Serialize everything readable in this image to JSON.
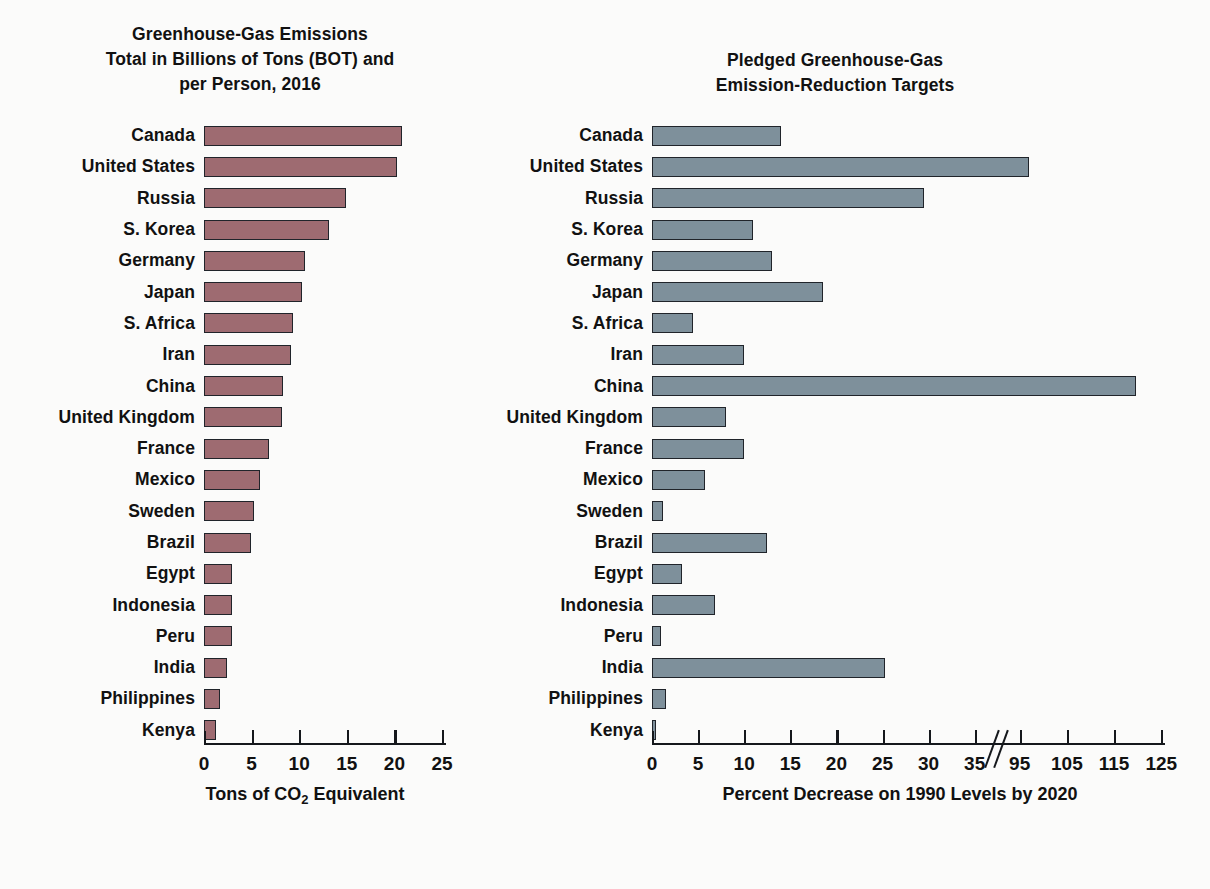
{
  "chart_data": [
    {
      "type": "bar",
      "orientation": "horizontal",
      "title": "Greenhouse-Gas Emissions Total in Billions of Tons (BOT) and per Person, 2016",
      "title_lines": [
        "Greenhouse-Gas Emissions",
        "Total in Billions of Tons (BOT) and",
        "per Person, 2016"
      ],
      "xlabel": "Tons of CO2 Equivalent",
      "xlabel_parts": {
        "pre": "Tons of CO",
        "sub": "2",
        "post": " Equivalent"
      },
      "ylabel": "",
      "xlim": [
        0,
        25
      ],
      "xticks": [
        0,
        5,
        10,
        15,
        20,
        25
      ],
      "xticklabels": [
        "0",
        "5",
        "10",
        "15",
        "20",
        "25"
      ],
      "grid": false,
      "legend": "none",
      "bar_color": "#9e6b71",
      "bar_edge_color": "#20242a",
      "categories": [
        "Canada",
        "United States",
        "Russia",
        "S. Korea",
        "Germany",
        "Japan",
        "S. Africa",
        "Iran",
        "China",
        "United Kingdom",
        "France",
        "Mexico",
        "Sweden",
        "Brazil",
        "Egypt",
        "Indonesia",
        "Peru",
        "India",
        "Philippines",
        "Kenya"
      ],
      "values": [
        20.8,
        20.3,
        14.9,
        13.1,
        10.6,
        10.3,
        9.3,
        9.1,
        8.3,
        8.2,
        6.8,
        5.9,
        5.3,
        4.9,
        2.9,
        2.9,
        2.9,
        2.4,
        1.7,
        1.3
      ]
    },
    {
      "type": "bar",
      "orientation": "horizontal",
      "title": "Pledged Greenhouse-Gas Emission-Reduction Targets",
      "title_lines": [
        "Pledged Greenhouse-Gas",
        "Emission-Reduction Targets"
      ],
      "xlabel": "Percent Decrease on 1990 Levels by 2020",
      "ylabel": "",
      "xlim": [
        0,
        125
      ],
      "axis_break": {
        "after": 35,
        "before": 95,
        "note": "axis break between 35 and 95"
      },
      "xticks": [
        0,
        5,
        10,
        15,
        20,
        25,
        30,
        35,
        95,
        105,
        115,
        125
      ],
      "xticklabels": [
        "0",
        "5",
        "10",
        "15",
        "20",
        "25",
        "30",
        "35",
        "95",
        "105",
        "115",
        "125"
      ],
      "grid": false,
      "legend": "none",
      "bar_color": "#7e909b",
      "bar_edge_color": "#20242a",
      "categories": [
        "Canada",
        "United States",
        "Russia",
        "S. Korea",
        "Germany",
        "Japan",
        "S. Africa",
        "Iran",
        "China",
        "United Kingdom",
        "France",
        "Mexico",
        "Sweden",
        "Brazil",
        "Egypt",
        "Indonesia",
        "Peru",
        "India",
        "Philippines",
        "Kenya"
      ],
      "values": [
        14.0,
        97.0,
        29.5,
        11.0,
        13.0,
        18.5,
        4.5,
        10.0,
        119.7,
        8.0,
        10.0,
        5.8,
        1.2,
        12.5,
        3.3,
        6.8,
        1.0,
        25.3,
        1.5,
        0.4
      ]
    }
  ]
}
